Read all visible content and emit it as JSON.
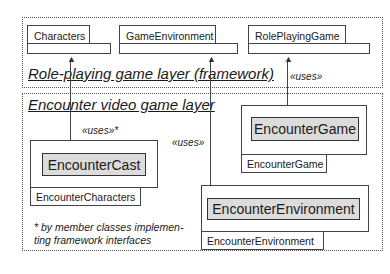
{
  "framework_layer": {
    "title": "Role-playing game layer (framework)",
    "packages": [
      {
        "name": "Characters"
      },
      {
        "name": "GameEnvironment"
      },
      {
        "name": "RolePlayingGame"
      }
    ]
  },
  "encounter_layer": {
    "title": "Encounter video game layer",
    "packages": [
      {
        "name": "EncounterCharacters",
        "class": "EncounterCast"
      },
      {
        "name": "EncounterGame",
        "class": "EncounterGame"
      },
      {
        "name": "EncounterEnvironment",
        "class": "EncounterEnvironment"
      }
    ]
  },
  "dependencies": {
    "characters_uses": "«uses»*",
    "environment_uses": "«uses»",
    "game_uses": "«uses»"
  },
  "footnote": "* by member classes implementing framework interfaces",
  "footnote_lines": [
    "* by member classes implemen-",
    "ting framework interfaces"
  ],
  "colors": {
    "class_fill": "#dcdcdc",
    "line": "#444444"
  }
}
